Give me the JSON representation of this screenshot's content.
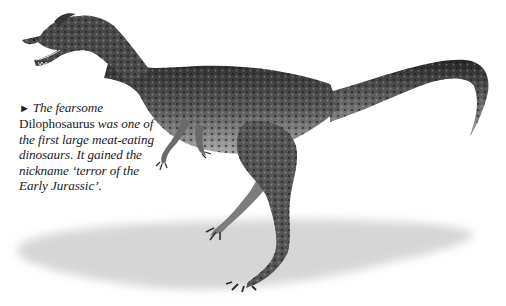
{
  "figure": {
    "style": "grayscale painted illustration on white",
    "colors": {
      "background": "#ffffff",
      "shadow": "#c9c9c9",
      "body_dark": "#2e2e2e",
      "body_mid": "#6b6b6b",
      "body_light": "#bdbdbd",
      "text": "#222222"
    }
  },
  "caption": {
    "marker_icon": "►",
    "intro": "The fearsome",
    "name": "Dilophosaurus",
    "line_rest": "was one of",
    "line3": "the first large meat-eating",
    "line4": "dinosaurs. It gained the",
    "line5": "nickname ‘terror of the",
    "line6": "Early Jurassic’."
  }
}
